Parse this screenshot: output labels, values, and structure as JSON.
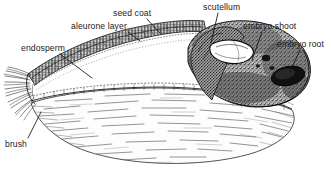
{
  "figure": {
    "type": "botanical-anatomy-diagram",
    "background_color": "#ffffff",
    "ink_color": "#1a1a1a",
    "width": 331,
    "height": 170
  },
  "labels": [
    {
      "id": "seed-coat",
      "text": "seed coat",
      "x": 113,
      "y": 8,
      "leader": {
        "x1": 147,
        "y1": 19,
        "x2": 160,
        "y2": 33
      }
    },
    {
      "id": "aleurone-layer",
      "text": "aleurone layer",
      "x": 71,
      "y": 21,
      "leader": {
        "x1": 128,
        "y1": 32,
        "x2": 140,
        "y2": 41
      }
    },
    {
      "id": "endosperm",
      "text": "endosperm",
      "x": 21,
      "y": 43,
      "leader": {
        "x1": 60,
        "y1": 54,
        "x2": 92,
        "y2": 78
      }
    },
    {
      "id": "scutellum",
      "text": "scutellum",
      "x": 203,
      "y": 2,
      "leader": {
        "x1": 218,
        "y1": 13,
        "x2": 211,
        "y2": 43
      }
    },
    {
      "id": "embryo-shoot",
      "text": "embryo shoot",
      "x": 243,
      "y": 21,
      "leader": {
        "x1": 262,
        "y1": 32,
        "x2": 252,
        "y2": 60
      }
    },
    {
      "id": "embryo-root",
      "text": "embryo root",
      "x": 277,
      "y": 39,
      "leader": {
        "x1": 300,
        "y1": 50,
        "x2": 290,
        "y2": 72
      }
    },
    {
      "id": "brush",
      "text": "brush",
      "x": 5,
      "y": 139,
      "leader": {
        "x1": 28,
        "y1": 138,
        "x2": 41,
        "y2": 112
      }
    }
  ],
  "structures": [
    {
      "id": "pericarp-seed-coat",
      "name": "seed coat / pericarp outer wall"
    },
    {
      "id": "aleurone-layer",
      "name": "aleurone layer"
    },
    {
      "id": "starchy-endosperm",
      "name": "starchy endosperm"
    },
    {
      "id": "scutellum",
      "name": "scutellum"
    },
    {
      "id": "embryo-shoot",
      "name": "embryo shoot (plumule)"
    },
    {
      "id": "embryo-root",
      "name": "embryo root (radicle)"
    },
    {
      "id": "brush",
      "name": "brush hairs"
    }
  ]
}
